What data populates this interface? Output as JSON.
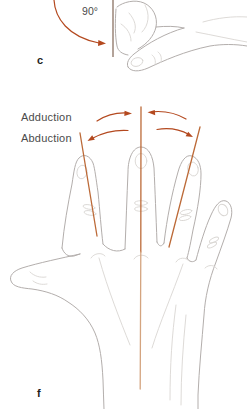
{
  "figure": {
    "panels": {
      "c": {
        "label": "c",
        "angle_label": "90°"
      },
      "f": {
        "label": "f",
        "adduction_label": "Adduction",
        "abduction_label": "Abduction"
      }
    },
    "colors": {
      "arrow": "#b4491f",
      "axis": "#bc6a38",
      "axis_light": "#d4a47f",
      "reference_line": "#9a8577",
      "sketch": "#b3aeac",
      "sketch_light": "#d9d6d3",
      "label_text": "#4b4b4b",
      "panel_label_text": "#1d1d1d",
      "background": "#ffffff"
    }
  }
}
